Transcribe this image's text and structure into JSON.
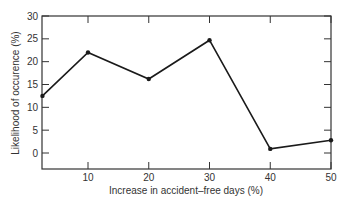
{
  "chart_data": {
    "type": "line",
    "title": "",
    "xlabel": "Increase in accident–free days (%)",
    "ylabel": "Likelihood of occurence (%)",
    "x": [
      2.5,
      10,
      20,
      30,
      40,
      50
    ],
    "values": [
      12.5,
      22,
      16.2,
      24.7,
      0.9,
      2.8
    ],
    "series": [
      {
        "name": "Likelihood of occurence",
        "x": [
          2.5,
          10,
          20,
          30,
          40,
          50
        ],
        "values": [
          12.5,
          22,
          16.2,
          24.7,
          0.9,
          2.8
        ]
      }
    ],
    "xticks": [
      10,
      20,
      30,
      40,
      50
    ],
    "yticks": [
      0,
      5,
      10,
      15,
      20,
      25,
      30
    ],
    "xlim": [
      2.5,
      50
    ],
    "ylim": [
      -3.5,
      30
    ],
    "grid": false,
    "legend": null,
    "colors": {
      "line": "#1a1a1a",
      "axis": "#333333",
      "text": "#333333"
    }
  }
}
